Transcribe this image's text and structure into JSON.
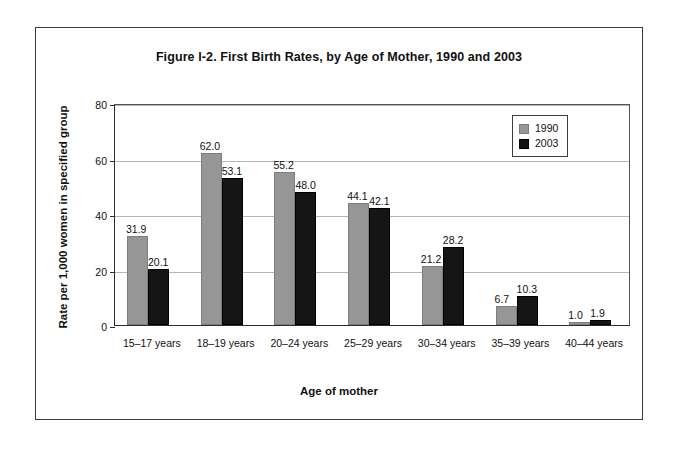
{
  "chart_data": {
    "type": "bar",
    "title": "Figure I-2. First Birth Rates, by Age of Mother, 1990 and 2003",
    "xlabel": "Age of mother",
    "ylabel": "Rate per 1,000 women in specified group",
    "categories": [
      "15–17 years",
      "18–19 years",
      "20–24 years",
      "25–29 years",
      "30–34 years",
      "35–39 years",
      "40–44 years"
    ],
    "series": [
      {
        "name": "1990",
        "color": "#969696",
        "values": [
          31.9,
          62.0,
          55.2,
          44.1,
          21.2,
          6.7,
          1.0
        ],
        "labels": [
          "31.9",
          "62.0",
          "55.2",
          "44.1",
          "21.2",
          "6.7",
          "1.0"
        ]
      },
      {
        "name": "2003",
        "color": "#151515",
        "values": [
          20.1,
          53.1,
          48.0,
          42.1,
          28.2,
          10.3,
          1.9
        ],
        "labels": [
          "20.1",
          "53.1",
          "48.0",
          "42.1",
          "28.2",
          "10.3",
          "1.9"
        ]
      }
    ],
    "ylim": [
      0,
      80
    ],
    "yticks": [
      0,
      20,
      40,
      60,
      80
    ],
    "ytick_labels": [
      "0",
      "20",
      "40",
      "60",
      "80"
    ],
    "grid": true,
    "legend_position": "top-right"
  }
}
